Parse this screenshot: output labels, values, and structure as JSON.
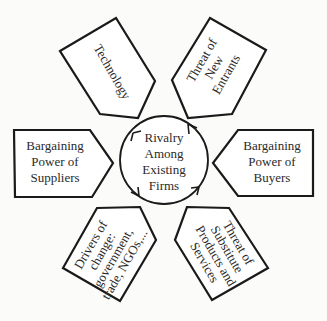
{
  "diagram": {
    "center": {
      "lines": [
        "Rivalry",
        "Among",
        "Existing",
        "Firms"
      ]
    },
    "forces": {
      "technology": {
        "lines": [
          "Technology"
        ]
      },
      "new_entrants": {
        "lines": [
          "Threat of",
          "New",
          "Entrants"
        ]
      },
      "suppliers": {
        "lines": [
          "Bargaining",
          "Power of",
          "Suppliers"
        ]
      },
      "buyers": {
        "lines": [
          "Bargaining",
          "Power of",
          "Buyers"
        ]
      },
      "drivers": {
        "lines": [
          "Drivers of",
          "change:",
          "government,",
          "trade, NGOs,..."
        ]
      },
      "substitutes": {
        "lines": [
          "Threat of",
          "Substitute",
          "Products and",
          "Services"
        ]
      }
    },
    "colors": {
      "stroke": "#1a1a1a",
      "fill": "#ffffff",
      "text": "#2a2a2a",
      "background": "#fbfbfa"
    }
  }
}
